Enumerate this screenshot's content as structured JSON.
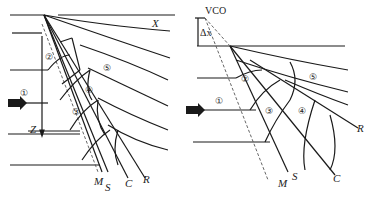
{
  "left_panel": {
    "axis_x_label": "X",
    "axis_z_label": "Z",
    "zones": [
      "①",
      "②",
      "③",
      "④",
      "⑤"
    ],
    "line_labels": {
      "m": "M",
      "s": "S",
      "c": "C",
      "r": "R"
    }
  },
  "right_panel": {
    "vco_label": "VCO",
    "dx_label": "Δx",
    "zones": [
      "①",
      "②",
      "③",
      "④",
      "⑤"
    ],
    "line_labels": {
      "m": "M",
      "s": "S",
      "c": "C",
      "r": "R"
    }
  },
  "colors": {
    "line": "#1a1a1a",
    "dashed": "#555555"
  }
}
